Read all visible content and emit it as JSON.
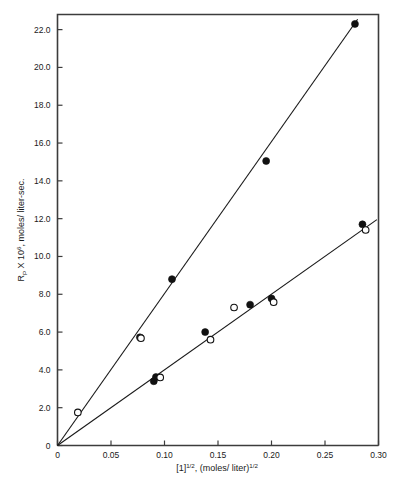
{
  "figure": {
    "background_color": "#ffffff",
    "frame_color": "#3c3c3c",
    "ink_color": "#1a1a1a"
  },
  "chart_data": {
    "type": "scatter",
    "title": "",
    "subtitle": "",
    "xlabel_parts": {
      "base1": "[1]",
      "exp1": "1/2",
      "mid": ", (moles/ liter)",
      "exp2": "1/2"
    },
    "ylabel_parts": {
      "base": "R",
      "sub": "P",
      "mid": " X 10",
      "exp": "6",
      "tail": ", moles/ liter-sec."
    },
    "xlabel": "[1]1/2, (moles/ liter)1/2",
    "ylabel": "RP X 106, moles/ liter-sec.",
    "xlim": [
      0,
      0.3
    ],
    "ylim": [
      0,
      22.8
    ],
    "xticks": [
      0,
      0.05,
      0.1,
      0.15,
      0.2,
      0.25,
      0.3
    ],
    "xtick_labels": [
      "0",
      "0.05",
      "0.10",
      "0.15",
      "0.20",
      "0.25",
      "0.30"
    ],
    "yticks": [
      0,
      2.0,
      4.0,
      6.0,
      8.0,
      10.0,
      12.0,
      14.0,
      16.0,
      18.0,
      20.0,
      22.0
    ],
    "ytick_labels": [
      "0",
      "2.0",
      "4.0",
      "6.0",
      "8.0",
      "10.0",
      "12.0",
      "14.0",
      "16.0",
      "18.0",
      "20.0",
      "22.0"
    ],
    "grid": false,
    "legend": false,
    "legend_position": "none",
    "series": [
      {
        "name": "upper-line-filled",
        "marker": "filled-circle",
        "points": [
          {
            "x": 0.077,
            "y": 5.72
          },
          {
            "x": 0.107,
            "y": 8.8
          },
          {
            "x": 0.195,
            "y": 15.05
          },
          {
            "x": 0.278,
            "y": 22.3
          }
        ]
      },
      {
        "name": "upper-line-open",
        "marker": "open-circle",
        "points": [
          {
            "x": 0.019,
            "y": 1.75
          },
          {
            "x": 0.078,
            "y": 5.68
          }
        ]
      },
      {
        "name": "lower-line-filled",
        "marker": "filled-circle",
        "points": [
          {
            "x": 0.09,
            "y": 3.4
          },
          {
            "x": 0.092,
            "y": 3.62
          },
          {
            "x": 0.138,
            "y": 6.0
          },
          {
            "x": 0.18,
            "y": 7.45
          },
          {
            "x": 0.2,
            "y": 7.78
          },
          {
            "x": 0.285,
            "y": 11.7
          }
        ]
      },
      {
        "name": "lower-line-open",
        "marker": "open-circle",
        "points": [
          {
            "x": 0.096,
            "y": 3.6
          },
          {
            "x": 0.143,
            "y": 5.6
          },
          {
            "x": 0.165,
            "y": 7.3
          },
          {
            "x": 0.202,
            "y": 7.58
          },
          {
            "x": 0.288,
            "y": 11.4
          }
        ]
      }
    ],
    "fit_lines": [
      {
        "name": "upper-fit",
        "x0": 0.0,
        "y0": 0.0,
        "x1": 0.2805,
        "y1": 22.55,
        "slope": 80.4
      },
      {
        "name": "lower-fit",
        "x0": 0.0,
        "y0": 0.0,
        "x1": 0.2985,
        "y1": 11.95,
        "slope": 40.0
      }
    ]
  }
}
